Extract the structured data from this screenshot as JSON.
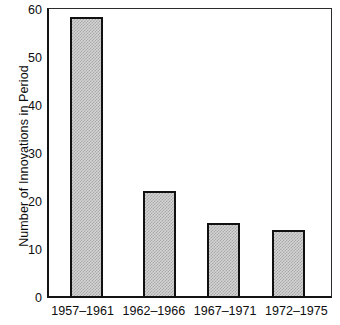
{
  "chart_data": {
    "type": "bar",
    "title": "",
    "subtitle": "",
    "xlabel": "",
    "ylabel": "Number of Innovations in Period",
    "categories": [
      "1957–1961",
      "1962–1966",
      "1967–1971",
      "1972–1975"
    ],
    "values": [
      58.5,
      22.3,
      15.6,
      14.2
    ],
    "ylim": [
      0,
      60
    ],
    "yticks": [
      0,
      10,
      20,
      30,
      40,
      50,
      60
    ],
    "ytick_labels": [
      "0",
      "10",
      "20",
      "30",
      "40",
      "50",
      "60"
    ],
    "grid": false,
    "legend": null,
    "legend_position": "none",
    "series": [
      {
        "name": "Number of Innovations in Period",
        "values": [
          58.5,
          22.3,
          15.6,
          14.2
        ]
      }
    ],
    "annotations": [],
    "bar_fill": "#d4d4d4",
    "bar_pattern": "checkerboard-halftone",
    "bar_edge_color": "#111111",
    "axis_color": "#141414",
    "background_color": "#ffffff"
  },
  "axes": {
    "y_title": "Number of Innovations in Period",
    "y_ticks": [
      {
        "label": "60",
        "value": 60
      },
      {
        "label": "50",
        "value": 50
      },
      {
        "label": "40",
        "value": 40
      },
      {
        "label": "30",
        "value": 30
      },
      {
        "label": "20",
        "value": 20
      },
      {
        "label": "10",
        "value": 10
      },
      {
        "label": "0",
        "value": 0
      }
    ],
    "x_ticks": [
      {
        "label": "1957–1961"
      },
      {
        "label": "1962–1966"
      },
      {
        "label": "1967–1971"
      },
      {
        "label": "1972–1975"
      }
    ]
  }
}
